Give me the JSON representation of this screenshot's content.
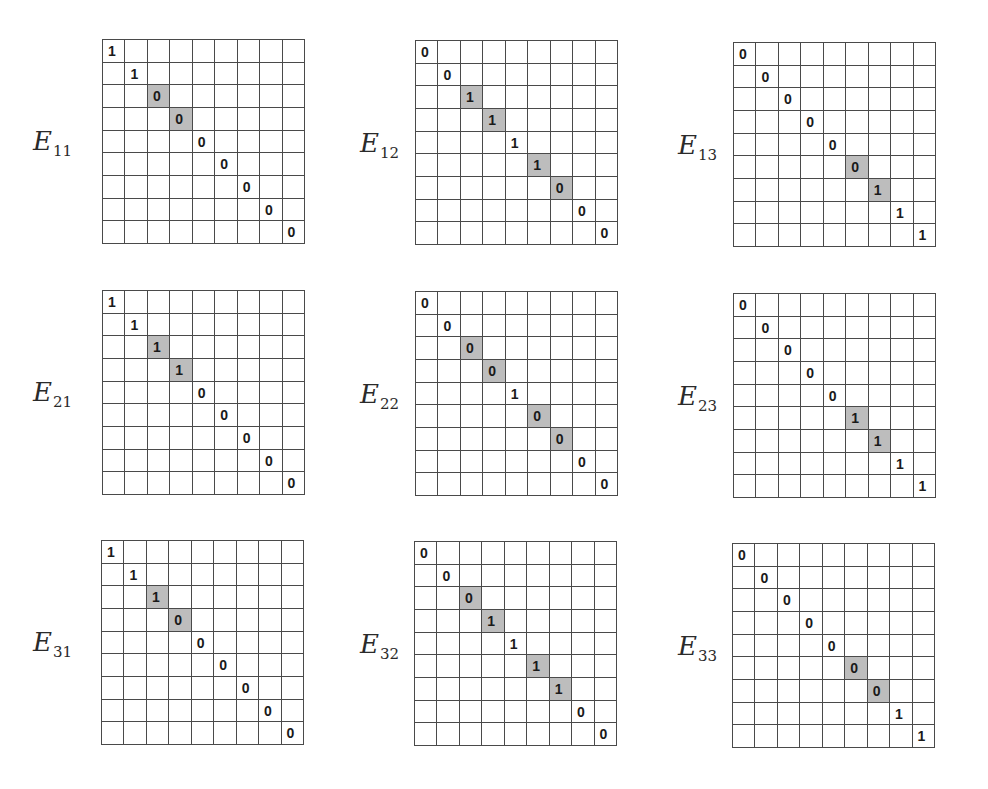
{
  "figure": {
    "shade_color": "#bdbdbd",
    "grid_size": 9,
    "matrices": [
      {
        "id": "E11",
        "base": "E",
        "sub": "11",
        "diag": [
          "1",
          "1",
          "0",
          "0",
          "0",
          "0",
          "0",
          "0",
          "0"
        ],
        "shaded": [
          2,
          3
        ],
        "x": 102,
        "y": 39,
        "label_x": 33,
        "label_y": 128
      },
      {
        "id": "E12",
        "base": "E",
        "sub": "12",
        "diag": [
          "0",
          "0",
          "1",
          "1",
          "1",
          "1",
          "0",
          "0",
          "0"
        ],
        "shaded": [
          2,
          3,
          5,
          6
        ],
        "x": 415,
        "y": 40,
        "label_x": 360,
        "label_y": 130
      },
      {
        "id": "E13",
        "base": "E",
        "sub": "13",
        "diag": [
          "0",
          "0",
          "0",
          "0",
          "0",
          "0",
          "1",
          "1",
          "1"
        ],
        "shaded": [
          5,
          6
        ],
        "x": 733,
        "y": 42,
        "label_x": 678,
        "label_y": 132
      },
      {
        "id": "E21",
        "base": "E",
        "sub": "21",
        "diag": [
          "1",
          "1",
          "1",
          "1",
          "0",
          "0",
          "0",
          "0",
          "0"
        ],
        "shaded": [
          2,
          3
        ],
        "x": 102,
        "y": 290,
        "label_x": 33,
        "label_y": 379
      },
      {
        "id": "E22",
        "base": "E",
        "sub": "22",
        "diag": [
          "0",
          "0",
          "0",
          "0",
          "1",
          "0",
          "0",
          "0",
          "0"
        ],
        "shaded": [
          2,
          3,
          5,
          6
        ],
        "x": 415,
        "y": 291,
        "label_x": 360,
        "label_y": 381
      },
      {
        "id": "E23",
        "base": "E",
        "sub": "23",
        "diag": [
          "0",
          "0",
          "0",
          "0",
          "0",
          "1",
          "1",
          "1",
          "1"
        ],
        "shaded": [
          5,
          6
        ],
        "x": 733,
        "y": 293,
        "label_x": 678,
        "label_y": 383
      },
      {
        "id": "E31",
        "base": "E",
        "sub": "31",
        "diag": [
          "1",
          "1",
          "1",
          "0",
          "0",
          "0",
          "0",
          "0",
          "0"
        ],
        "shaded": [
          2,
          3
        ],
        "x": 101,
        "y": 540,
        "label_x": 33,
        "label_y": 629
      },
      {
        "id": "E32",
        "base": "E",
        "sub": "32",
        "diag": [
          "0",
          "0",
          "0",
          "1",
          "1",
          "1",
          "1",
          "0",
          "0"
        ],
        "shaded": [
          2,
          3,
          5,
          6
        ],
        "x": 414,
        "y": 541,
        "label_x": 360,
        "label_y": 631
      },
      {
        "id": "E33",
        "base": "E",
        "sub": "33",
        "diag": [
          "0",
          "0",
          "0",
          "0",
          "0",
          "0",
          "0",
          "1",
          "1"
        ],
        "shaded": [
          5,
          6
        ],
        "x": 732,
        "y": 543,
        "label_x": 678,
        "label_y": 633
      }
    ]
  }
}
